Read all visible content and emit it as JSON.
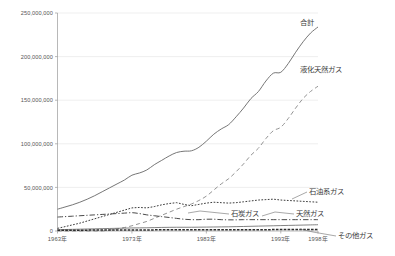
{
  "chart_data": {
    "type": "line",
    "title": "",
    "subtitle": "",
    "xlabel": "",
    "ylabel": "",
    "grid": true,
    "legend_position": "inline-right-labels",
    "xlim": [
      1963,
      1998
    ],
    "ylim": [
      0,
      250000000
    ],
    "yticks": [
      0,
      50000000,
      100000000,
      150000000,
      200000000,
      250000000
    ],
    "ytick_labels": [
      "0",
      "50,000,000",
      "100,000,000",
      "150,000,000",
      "200,000,000",
      "250,000,000"
    ],
    "xticks": [
      1963,
      1973,
      1983,
      1993,
      1998
    ],
    "xtick_labels": [
      "1963年",
      "1973年",
      "1983年",
      "1993年",
      "1998年"
    ],
    "x": [
      1963,
      1964,
      1965,
      1966,
      1967,
      1968,
      1969,
      1970,
      1971,
      1972,
      1973,
      1974,
      1975,
      1976,
      1977,
      1978,
      1979,
      1980,
      1981,
      1982,
      1983,
      1984,
      1985,
      1986,
      1987,
      1988,
      1989,
      1990,
      1991,
      1992,
      1993,
      1994,
      1995,
      1996,
      1997,
      1998
    ],
    "series": [
      {
        "name": "合計",
        "label": "合計",
        "style": "solid",
        "color": "#6f6f6f",
        "values": [
          25000000,
          27500000,
          30000000,
          33000000,
          36500000,
          40500000,
          45000000,
          49500000,
          54000000,
          58500000,
          64000000,
          66500000,
          70000000,
          76000000,
          81000000,
          86000000,
          90000000,
          91500000,
          92000000,
          96000000,
          103000000,
          111000000,
          117000000,
          122000000,
          131000000,
          141000000,
          152000000,
          160000000,
          172000000,
          181000000,
          182000000,
          192000000,
          205000000,
          217000000,
          227000000,
          234000000
        ]
      },
      {
        "name": "液化天然ガス",
        "label": "液化天然ガス",
        "style": "dashed",
        "color": "#8d8d8d",
        "values": [
          0,
          0,
          0,
          0,
          0,
          0,
          0,
          1000000,
          2500000,
          4000000,
          6000000,
          8500000,
          11000000,
          14500000,
          18000000,
          21500000,
          25000000,
          28000000,
          31000000,
          35000000,
          40000000,
          47000000,
          54000000,
          60000000,
          68000000,
          77000000,
          87000000,
          95000000,
          106000000,
          115000000,
          119000000,
          129000000,
          141000000,
          152000000,
          160000000,
          166000000
        ]
      },
      {
        "name": "石油系ガス",
        "label": "石油系ガス",
        "style": "dotted",
        "color": "#3c3c3c",
        "values": [
          3000000,
          5000000,
          7000000,
          9000000,
          11500000,
          14000000,
          16500000,
          19000000,
          21500000,
          24000000,
          26500000,
          27000000,
          26500000,
          28000000,
          30000000,
          31500000,
          32500000,
          30500000,
          29000000,
          30500000,
          32000000,
          33000000,
          32500000,
          32000000,
          32500000,
          33500000,
          34500000,
          35500000,
          36000000,
          36500000,
          35500000,
          35000000,
          34500000,
          34000000,
          33500000,
          33000000
        ]
      },
      {
        "name": "石炭ガス",
        "label": "石炭ガス",
        "style": "dashdot",
        "color": "#4a4a4a",
        "values": [
          16000000,
          16500000,
          17000000,
          17500000,
          18000000,
          18500000,
          19000000,
          19500000,
          20000000,
          20500000,
          21000000,
          20000000,
          18500000,
          17500000,
          16500000,
          15500000,
          14500000,
          13500000,
          13000000,
          13000000,
          13500000,
          13500000,
          13000000,
          12800000,
          12800000,
          13000000,
          13000000,
          13000000,
          13000000,
          13000000,
          13000000,
          13000000,
          13000000,
          13000000,
          13000000,
          13000000
        ]
      },
      {
        "name": "天然ガス",
        "label": "天然ガス",
        "style": "thin-solid",
        "color": "#5a5a5a",
        "values": [
          1500000,
          1700000,
          1900000,
          2100000,
          2300000,
          2500000,
          2700000,
          2900000,
          3100000,
          3300000,
          3500000,
          3600000,
          3700000,
          3900000,
          4100000,
          4200000,
          4300000,
          4300000,
          4300000,
          4400000,
          4500000,
          4600000,
          4700000,
          4800000,
          5000000,
          5200000,
          5400000,
          5600000,
          5800000,
          6000000,
          6200000,
          6400000,
          6600000,
          6800000,
          7000000,
          7200000
        ]
      },
      {
        "name": "その他ガス",
        "label": "その他ガス",
        "style": "dense-dash",
        "color": "#2e2e2e",
        "values": [
          1000000,
          1000000,
          1000000,
          1000000,
          1000000,
          1100000,
          1100000,
          1100000,
          1200000,
          1200000,
          1200000,
          1200000,
          1200000,
          1300000,
          1300000,
          1300000,
          1300000,
          1300000,
          1300000,
          1400000,
          1400000,
          1400000,
          1400000,
          1400000,
          1500000,
          1500000,
          1500000,
          1500000,
          1500000,
          1600000,
          1600000,
          1600000,
          1600000,
          1700000,
          1700000,
          1700000
        ]
      }
    ],
    "annotations": [
      {
        "text": "合計",
        "x": 1998,
        "y": 234000000
      },
      {
        "text": "液化天然ガス",
        "x": 1998,
        "y": 166000000
      },
      {
        "text": "石油系ガス",
        "x": 1998,
        "y": 33000000
      },
      {
        "text": "石炭ガス",
        "x": 1983,
        "y": 13500000
      },
      {
        "text": "天然ガス",
        "x": 1995,
        "y": 6600000
      },
      {
        "text": "その他ガス",
        "x": 1998,
        "y": 1700000
      }
    ]
  }
}
